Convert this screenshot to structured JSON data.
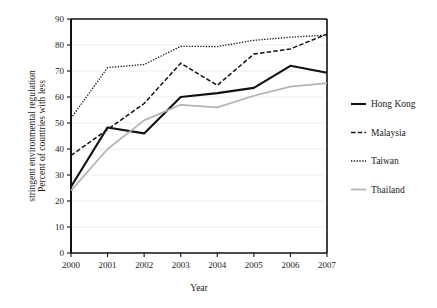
{
  "chart_data": {
    "type": "line",
    "title": "",
    "xlabel": "Year",
    "ylabel": "Percent  of countries with less stringent environmental regulation",
    "ylabel_line1": "Percent  of countries with less",
    "ylabel_line2": "stringent environmental regulation",
    "categories": [
      "2000",
      "2001",
      "2002",
      "2003",
      "2004",
      "2005",
      "2006",
      "2007"
    ],
    "x": [
      2000,
      2001,
      2002,
      2003,
      2004,
      2005,
      2006,
      2007
    ],
    "xlim": [
      2000,
      2007
    ],
    "ylim": [
      0,
      90
    ],
    "yticks": [
      0,
      10,
      20,
      30,
      40,
      50,
      60,
      70,
      80,
      90
    ],
    "xticks": [
      "2000",
      "2001",
      "2002",
      "2003",
      "2004",
      "2005",
      "2006",
      "2007"
    ],
    "grid": "horizontal",
    "legend_position": "right",
    "series": [
      {
        "name": "Hong Kong",
        "style": "solid",
        "color": "#111111",
        "width": 2.1,
        "values": [
          25.5,
          48.3,
          46.0,
          60.0,
          61.5,
          63.5,
          72.0,
          69.3
        ]
      },
      {
        "name": "Malaysia",
        "style": "dashed",
        "color": "#111111",
        "width": 1.5,
        "values": [
          37.5,
          47.5,
          57.5,
          73.0,
          64.5,
          76.5,
          78.5,
          84.2
        ]
      },
      {
        "name": "Taiwan",
        "style": "dotted",
        "color": "#111111",
        "width": 1.3,
        "values": [
          51.8,
          71.3,
          72.5,
          79.5,
          79.4,
          81.8,
          83.0,
          83.8
        ]
      },
      {
        "name": "Thailand",
        "style": "solid",
        "color": "#b3b3b3",
        "width": 1.7,
        "values": [
          24.0,
          40.0,
          51.0,
          57.0,
          56.0,
          60.5,
          64.0,
          65.3
        ]
      }
    ],
    "colors": {
      "axis": "#111111",
      "grid": "#ededed",
      "background": "#ffffff",
      "text": "#1a1a1a"
    }
  },
  "legend": {
    "items": [
      {
        "label": "Hong Kong"
      },
      {
        "label": "Malaysia"
      },
      {
        "label": "Taiwan"
      },
      {
        "label": "Thailand"
      }
    ]
  }
}
